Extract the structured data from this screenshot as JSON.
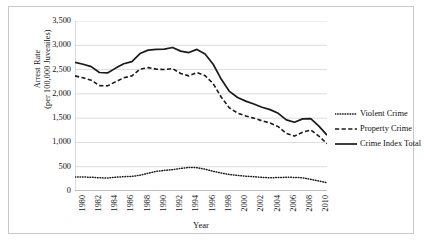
{
  "chart_data": {
    "type": "line",
    "title": "",
    "xlabel": "Year",
    "ylabel": "Arrest Rate (per 100,000 Juveniles)",
    "ylabel_line1": "Arrest Rate",
    "ylabel_line2": "(per 100,000 Juveniles)",
    "xlim": [
      1980,
      2011
    ],
    "ylim": [
      0,
      3500
    ],
    "ytick_step": 500,
    "xtick_step": 2,
    "grid": "horizontal",
    "legend_position": "right",
    "yticks": [
      "3,500",
      "3,000",
      "2,500",
      "2,000",
      "1,500",
      "1,000",
      "500",
      "0"
    ],
    "ytick_values": [
      3500,
      3000,
      2500,
      2000,
      1500,
      1000,
      500,
      0
    ],
    "xticks": [
      "1980",
      "1982",
      "1984",
      "1986",
      "1988",
      "1990",
      "1992",
      "1994",
      "1996",
      "1998",
      "2000",
      "2002",
      "2004",
      "2006",
      "2008",
      "2010"
    ],
    "x": [
      1980,
      1981,
      1982,
      1983,
      1984,
      1985,
      1986,
      1987,
      1988,
      1989,
      1990,
      1991,
      1992,
      1993,
      1994,
      1995,
      1996,
      1997,
      1998,
      1999,
      2000,
      2001,
      2002,
      2003,
      2004,
      2005,
      2006,
      2007,
      2008,
      2009,
      2010,
      2011
    ],
    "series": [
      {
        "name": "Violent Crime",
        "style": "dotted",
        "color": "#1a1a1a",
        "values": [
          290,
          288,
          283,
          272,
          268,
          283,
          295,
          300,
          325,
          365,
          405,
          425,
          440,
          465,
          485,
          480,
          450,
          405,
          370,
          340,
          320,
          305,
          295,
          280,
          272,
          278,
          282,
          280,
          272,
          240,
          205,
          172
        ]
      },
      {
        "name": "Property Crime",
        "style": "dashed",
        "color": "#1a1a1a",
        "values": [
          2370,
          2330,
          2280,
          2170,
          2165,
          2250,
          2330,
          2370,
          2510,
          2540,
          2510,
          2500,
          2520,
          2420,
          2370,
          2440,
          2375,
          2210,
          1930,
          1710,
          1605,
          1545,
          1500,
          1445,
          1400,
          1325,
          1185,
          1130,
          1210,
          1255,
          1130,
          975
        ]
      },
      {
        "name": "Crime Index Total",
        "style": "solid",
        "color": "#1a1a1a",
        "values": [
          2650,
          2610,
          2560,
          2440,
          2430,
          2530,
          2620,
          2665,
          2830,
          2900,
          2915,
          2920,
          2955,
          2880,
          2850,
          2915,
          2820,
          2610,
          2300,
          2050,
          1925,
          1850,
          1790,
          1725,
          1675,
          1600,
          1465,
          1415,
          1485,
          1490,
          1335,
          1150
        ]
      }
    ]
  },
  "legend": {
    "entries": [
      {
        "label": "Violent Crime",
        "style": "dotted"
      },
      {
        "label": "Property Crime",
        "style": "dashed"
      },
      {
        "label": "Crime Index Total",
        "style": "solid"
      }
    ]
  }
}
